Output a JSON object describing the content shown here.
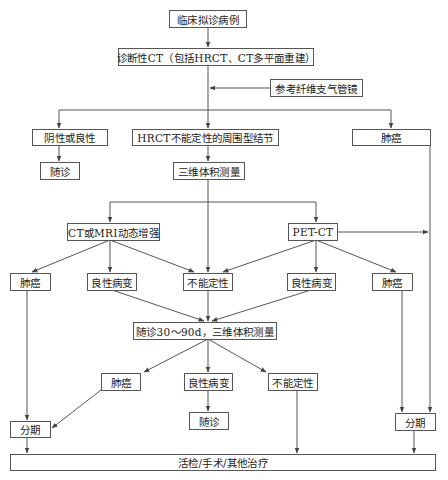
{
  "diagram": {
    "type": "flowchart",
    "nodes": {
      "start": "临床拟诊病例",
      "diag_ct": "诊断性CT（包括HRCT、CT多平面重建）",
      "bronch": "参考纤维支气管镜",
      "neg_benign": "阴性或良性",
      "followup1": "随诊",
      "hrct_indet": "HRCT不能定性的周围型结节",
      "cancer_top": "肺癌",
      "vol3d": "三维体积测量",
      "ct_mri": "CT或MRI动态增强",
      "pet_ct": "PET-CT",
      "cancer_l": "肺癌",
      "benign_l": "良性病变",
      "indet_mid": "不能定性",
      "benign_r": "良性病变",
      "cancer_r": "肺癌",
      "followup_vol": "随诊30～90d，三维体积测量",
      "cancer_low": "肺癌",
      "benign_low": "良性病变",
      "indet_low": "不能定性",
      "followup2": "随诊",
      "stage_l": "分期",
      "stage_r": "分期",
      "treatment": "活检/手术/其他治疗"
    },
    "edges": [
      [
        "start",
        "diag_ct"
      ],
      [
        "bronch",
        "diag_ct-trunk"
      ],
      [
        "diag_ct",
        "neg_benign"
      ],
      [
        "diag_ct",
        "hrct_indet"
      ],
      [
        "diag_ct",
        "cancer_top"
      ],
      [
        "neg_benign",
        "followup1"
      ],
      [
        "hrct_indet",
        "vol3d"
      ],
      [
        "vol3d",
        "ct_mri"
      ],
      [
        "vol3d",
        "indet_mid"
      ],
      [
        "vol3d",
        "pet_ct"
      ],
      [
        "ct_mri",
        "cancer_l"
      ],
      [
        "ct_mri",
        "benign_l"
      ],
      [
        "ct_mri",
        "indet_mid"
      ],
      [
        "pet_ct",
        "indet_mid"
      ],
      [
        "pet_ct",
        "benign_r"
      ],
      [
        "pet_ct",
        "cancer_r"
      ],
      [
        "pet_ct",
        "stage_r"
      ],
      [
        "benign_l",
        "followup_vol"
      ],
      [
        "indet_mid",
        "followup_vol"
      ],
      [
        "benign_r",
        "followup_vol"
      ],
      [
        "followup_vol",
        "cancer_low"
      ],
      [
        "followup_vol",
        "benign_low"
      ],
      [
        "followup_vol",
        "indet_low"
      ],
      [
        "benign_low",
        "followup2"
      ],
      [
        "cancer_l",
        "stage_l"
      ],
      [
        "cancer_low",
        "stage_l"
      ],
      [
        "cancer_r",
        "stage_r"
      ],
      [
        "cancer_top",
        "stage_r"
      ],
      [
        "stage_l",
        "treatment"
      ],
      [
        "indet_low",
        "treatment"
      ],
      [
        "stage_r",
        "treatment"
      ]
    ],
    "colors": {
      "line": "#555555",
      "text": "#222222",
      "background": "#ffffff"
    }
  }
}
